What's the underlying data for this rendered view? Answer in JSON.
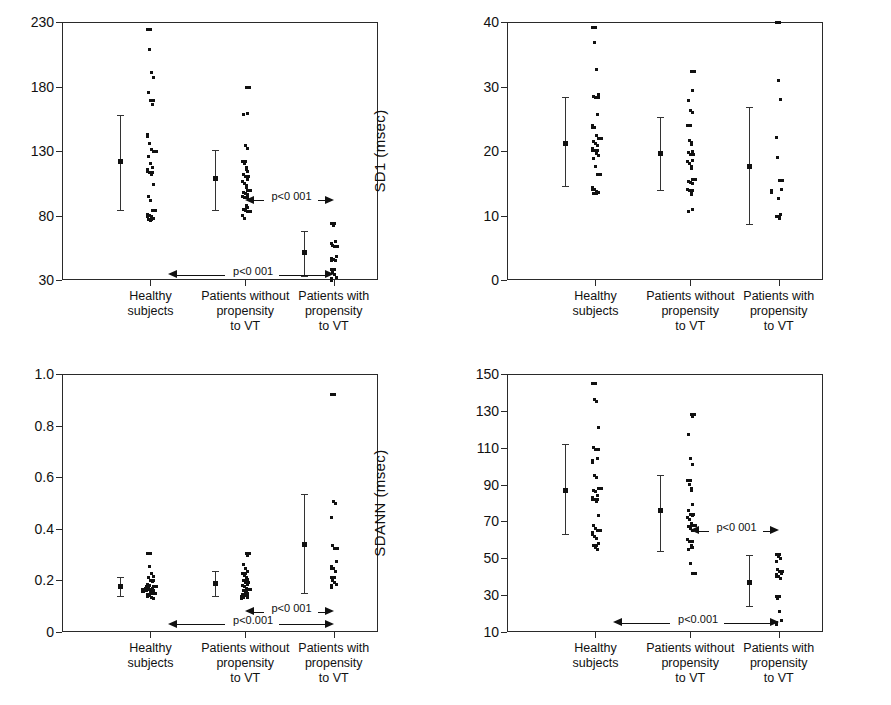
{
  "figure": {
    "panel_count": 4,
    "categories": [
      "Healthy subjects",
      "Patients without propensity to VT",
      "Patients with propensity to VT"
    ],
    "category_lines": [
      [
        "Healthy",
        "subjects"
      ],
      [
        "Patients without",
        "propensity",
        "to VT"
      ],
      [
        "Patients with",
        "propensity",
        "to VT"
      ]
    ],
    "colors": {
      "axis": "#2a2a2a",
      "marker": "#111111",
      "background": "#ffffff"
    }
  },
  "chart_data": [
    {
      "id": "sd2",
      "type": "scatter",
      "title": "",
      "ylabel": "SD2 (msec)",
      "xlabel": "",
      "ylim": [
        30,
        230
      ],
      "yticks": [
        30,
        80,
        130,
        180,
        230
      ],
      "ytick_labels": [
        "30",
        "80",
        "130",
        "180",
        "230"
      ],
      "grid": false,
      "legend": "none",
      "categories": [
        "Healthy subjects",
        "Patients without propensity to VT",
        "Patients with propensity to VT"
      ],
      "series": [
        {
          "name": "Healthy subjects",
          "values": [
            224,
            209,
            191,
            187,
            175,
            169,
            166,
            143,
            136,
            131,
            130,
            126,
            120,
            117,
            116,
            113,
            112,
            104,
            95,
            92,
            84,
            81,
            80,
            79,
            78,
            77,
            76
          ],
          "mean": 122,
          "sd_low": 84,
          "sd_high": 158
        },
        {
          "name": "Patients without propensity to VT",
          "values": [
            179,
            159,
            158,
            134,
            132,
            122,
            120,
            117,
            114,
            112,
            110,
            108,
            106,
            105,
            103,
            99,
            98,
            97,
            96,
            95,
            94,
            88,
            86,
            85,
            84,
            83,
            80,
            78
          ],
          "mean": 109,
          "sd_low": 84,
          "sd_high": 131
        },
        {
          "name": "Patients with propensity to VT",
          "values": [
            74,
            72,
            60,
            58,
            57,
            56,
            48,
            47,
            46,
            45,
            38,
            36,
            34,
            32,
            31
          ],
          "mean": 52,
          "sd_low": 33,
          "sd_high": 68
        }
      ],
      "annotations": [
        {
          "label": "p<0 001",
          "from": "Patients without propensity to VT",
          "to": "Patients with propensity to VT",
          "y": 92
        },
        {
          "label": "p<0 001",
          "from": "Healthy subjects",
          "to": "Patients with propensity to VT",
          "y": 34
        }
      ]
    },
    {
      "id": "sd1",
      "type": "scatter",
      "title": "",
      "ylabel": "SD1 (msec)",
      "xlabel": "",
      "ylim": [
        0,
        40
      ],
      "yticks": [
        0,
        10,
        20,
        30,
        40
      ],
      "ytick_labels": [
        "0",
        "10",
        "20",
        "30",
        "40"
      ],
      "grid": false,
      "legend": "none",
      "categories": [
        "Healthy subjects",
        "Patients without propensity to VT",
        "Patients with propensity to VT"
      ],
      "series": [
        {
          "name": "Healthy subjects",
          "values": [
            39.2,
            36.8,
            32.6,
            28.7,
            28.5,
            28.3,
            25.6,
            23.9,
            23.6,
            22.4,
            21.9,
            21.5,
            21.1,
            20.8,
            20.4,
            20.1,
            19.6,
            19.3,
            18.9,
            17.6,
            16.4,
            14.3,
            14.0,
            13.7,
            13.5,
            13.4
          ],
          "mean": 21.2,
          "sd_low": 14.5,
          "sd_high": 28.3
        },
        {
          "name": "Patients without propensity to VT",
          "values": [
            32.4,
            29.4,
            27.8,
            26.3,
            26.0,
            24.0,
            21.6,
            21.3,
            20.0,
            19.8,
            19.4,
            18.6,
            18.3,
            18.1,
            17.6,
            15.6,
            15.3,
            15.1,
            14.9,
            14.1,
            13.8,
            13.6,
            11.0,
            10.6
          ],
          "mean": 19.7,
          "sd_low": 14.0,
          "sd_high": 25.2
        },
        {
          "name": "Patients with propensity to VT",
          "values": [
            39.9,
            31.0,
            28.0,
            22.1,
            19.0,
            15.4,
            14.0,
            13.9,
            12.6,
            10.1,
            9.9,
            9.8,
            9.6
          ],
          "mean": 17.7,
          "sd_low": 8.7,
          "sd_high": 26.8
        }
      ],
      "annotations": []
    },
    {
      "id": "sd1_sd2",
      "type": "scatter",
      "title": "",
      "ylabel": "SD1/SD2",
      "xlabel": "",
      "ylim": [
        0,
        1.0
      ],
      "yticks": [
        0,
        0.2,
        0.4,
        0.6,
        0.8,
        1.0
      ],
      "ytick_labels": [
        "0",
        "0.2",
        "0.4",
        "0.6",
        "0.8",
        "1.0"
      ],
      "grid": false,
      "legend": "none",
      "categories": [
        "Healthy subjects",
        "Patients without propensity to VT",
        "Patients with propensity to VT"
      ],
      "series": [
        {
          "name": "Healthy subjects",
          "values": [
            0.305,
            0.255,
            0.225,
            0.215,
            0.21,
            0.2,
            0.195,
            0.185,
            0.18,
            0.178,
            0.175,
            0.172,
            0.17,
            0.168,
            0.166,
            0.164,
            0.162,
            0.16,
            0.158,
            0.155,
            0.15,
            0.145,
            0.14,
            0.135,
            0.13
          ],
          "mean": 0.178,
          "sd_low": 0.14,
          "sd_high": 0.215
        },
        {
          "name": "Patients without propensity to VT",
          "values": [
            0.305,
            0.295,
            0.26,
            0.245,
            0.235,
            0.225,
            0.22,
            0.21,
            0.205,
            0.2,
            0.19,
            0.185,
            0.18,
            0.175,
            0.17,
            0.165,
            0.16,
            0.155,
            0.15,
            0.145,
            0.14,
            0.138,
            0.135,
            0.132
          ],
          "mean": 0.19,
          "sd_low": 0.14,
          "sd_high": 0.235
        },
        {
          "name": "Patients with propensity to VT",
          "values": [
            0.92,
            0.505,
            0.5,
            0.445,
            0.335,
            0.325,
            0.275,
            0.255,
            0.245,
            0.235,
            0.21,
            0.2,
            0.19,
            0.185,
            0.18
          ],
          "mean": 0.34,
          "sd_low": 0.15,
          "sd_high": 0.535
        }
      ],
      "annotations": [
        {
          "label": "p<0 001",
          "from": "Patients without propensity to VT",
          "to": "Patients with propensity to VT",
          "y": 0.078
        },
        {
          "label": "p<0.001",
          "from": "Healthy subjects",
          "to": "Patients with propensity to VT",
          "y": 0.03
        }
      ]
    },
    {
      "id": "sdann",
      "type": "scatter",
      "title": "",
      "ylabel": "SDANN (msec)",
      "xlabel": "",
      "ylim": [
        10,
        150
      ],
      "yticks": [
        10,
        30,
        50,
        70,
        90,
        110,
        130,
        150
      ],
      "ytick_labels": [
        "10",
        "30",
        "50",
        "70",
        "90",
        "110",
        "130",
        "150"
      ],
      "grid": false,
      "legend": "none",
      "categories": [
        "Healthy subjects",
        "Patients without propensity to VT",
        "Patients with propensity to VT"
      ],
      "series": [
        {
          "name": "Healthy subjects",
          "values": [
            145,
            136,
            135,
            121,
            110,
            109,
            104,
            103,
            95,
            94,
            88,
            87,
            86,
            84,
            83,
            82,
            81,
            73,
            68,
            66,
            65,
            64,
            62,
            61,
            58,
            57,
            56,
            55
          ],
          "mean": 87,
          "sd_low": 63,
          "sd_high": 112
        },
        {
          "name": "Patients without propensity to VT",
          "values": [
            128,
            127,
            117,
            104,
            101,
            92,
            90,
            88,
            79,
            76,
            74,
            73,
            72,
            71,
            69,
            68,
            67,
            66,
            65,
            60,
            59,
            57,
            56,
            55,
            47,
            42
          ],
          "mean": 76,
          "sd_low": 54,
          "sd_high": 95
        },
        {
          "name": "Patients with propensity to VT",
          "values": [
            52,
            51,
            50,
            48,
            44,
            43,
            42,
            41,
            40,
            39,
            29,
            28,
            21,
            16,
            15
          ],
          "mean": 37,
          "sd_low": 24,
          "sd_high": 52
        }
      ],
      "annotations": [
        {
          "label": "p<0 001",
          "from": "Patients without propensity to VT",
          "to": "Patients with propensity to VT",
          "y": 65
        },
        {
          "label": "p<0.001",
          "from": "Healthy subjects",
          "to": "Patients with propensity to VT",
          "y": 15
        }
      ]
    }
  ]
}
